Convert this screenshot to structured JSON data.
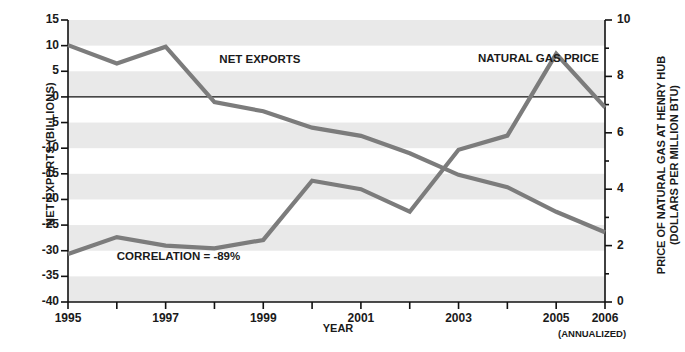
{
  "chart_data": {
    "type": "line",
    "title": "",
    "xlabel": "YEAR",
    "x": [
      1995,
      1996,
      1997,
      1998,
      1999,
      2000,
      2001,
      2002,
      2003,
      2004,
      2005,
      2006
    ],
    "x_tick_labels": [
      "1995",
      "",
      "1997",
      "",
      "1999",
      "",
      "2001",
      "",
      "2003",
      "",
      "2005",
      "2006"
    ],
    "x_tick_sublabel": "(ANNUALIZED)",
    "grid": "alternating horizontal bands",
    "legend_position": "inline annotations",
    "series": [
      {
        "name": "NET EXPORTS",
        "axis": "left",
        "ylabel": "NET EXPORTS (BILLIONS)",
        "ylim": [
          -40,
          15
        ],
        "y_tick_labels": [
          "15",
          "10",
          "5",
          "0",
          "-5",
          "-10",
          "-15",
          "-20",
          "-25",
          "-30",
          "-35",
          "-40"
        ],
        "y_ticks": [
          15,
          10,
          5,
          0,
          -5,
          -10,
          -15,
          -20,
          -25,
          -30,
          -35,
          -40
        ],
        "values": [
          10.1,
          6.5,
          9.8,
          -1.0,
          -2.8,
          -6.0,
          -7.6,
          -11.0,
          -15.2,
          -17.6,
          -22.4,
          -26.4
        ],
        "color": "#7c7c7c"
      },
      {
        "name": "NATURAL GAS PRICE",
        "axis": "right",
        "ylabel_line1": "PRICE OF NATURAL GAS AT HENRY HUB",
        "ylabel_line2": "(DOLLARS PER MILLION BTU)",
        "ylim": [
          0,
          10
        ],
        "y_ticks": [
          0,
          1,
          2,
          3,
          4,
          5,
          6,
          7,
          8,
          9,
          10
        ],
        "y_tick_labels": [
          "0",
          "",
          "2",
          "",
          "4",
          "",
          "6",
          "",
          "8",
          "",
          "10"
        ],
        "values": [
          1.7,
          2.3,
          2.0,
          1.9,
          2.2,
          4.3,
          4.0,
          3.2,
          5.4,
          5.9,
          8.8,
          6.9
        ],
        "color": "#7c7c7c"
      }
    ],
    "annotations": [
      {
        "text": "NET EXPORTS",
        "x": 1998.1,
        "y_left": 7.0
      },
      {
        "text": "NATURAL GAS PRICE",
        "x": 2003.4,
        "y_left": 7.2
      },
      {
        "text": "CORRELATION = -89%",
        "x": 1996.0,
        "y_left": -31.5
      }
    ],
    "zero_line": {
      "value": 0,
      "axis": "left",
      "color": "#111111"
    },
    "band_color": "#e9e9e9",
    "background": "#ffffff"
  }
}
